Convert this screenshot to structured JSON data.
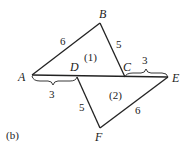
{
  "figure_label": "(b)",
  "points": {
    "A": "A",
    "B": "B",
    "C": "C",
    "D": "D",
    "E": "E",
    "F": "F"
  },
  "triangles": [
    {
      "label": "(1)",
      "vertices": [
        "A",
        "B",
        "C"
      ]
    },
    {
      "label": "(2)",
      "vertices": [
        "D",
        "E",
        "F"
      ]
    }
  ],
  "lengths": {
    "AB": "6",
    "BC": "5",
    "AD": "3",
    "CE": "3",
    "DF": "5",
    "FE": "6"
  }
}
